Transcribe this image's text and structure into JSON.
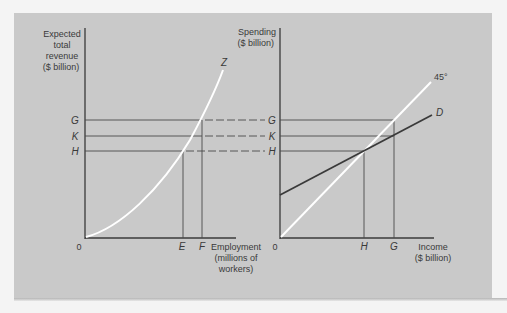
{
  "left_panel": {
    "y_axis_label": [
      "Expected",
      "total",
      "revenue",
      "($ billion)"
    ],
    "x_axis_label": [
      "Employment",
      "(millions of",
      "workers)"
    ],
    "origin": "0",
    "curve_label": "Z",
    "y_ticks": [
      "G",
      "K",
      "H"
    ],
    "x_ticks": [
      "E",
      "F"
    ]
  },
  "right_panel": {
    "y_axis_label": [
      "Spending",
      "($ billion)"
    ],
    "x_axis_label": [
      "Income",
      "($ billion)"
    ],
    "origin": "0",
    "line_labels": {
      "diagonal": "45°",
      "demand": "D"
    },
    "y_ticks": [
      "G",
      "K",
      "H"
    ],
    "x_ticks": [
      "H",
      "G"
    ]
  },
  "colors": {
    "background": "#c9c9c9",
    "axis": "#3a3a3a",
    "highlight_curve": "#ffffff"
  }
}
